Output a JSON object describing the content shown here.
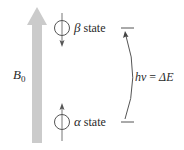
{
  "diagram": {
    "field": {
      "label": "B",
      "subscript": "0",
      "arrow_color": "#cbcbcb"
    },
    "beta": {
      "symbol": "β",
      "label": " state",
      "spin_direction": "down"
    },
    "alpha": {
      "symbol": "α",
      "label": " state",
      "spin_direction": "up"
    },
    "transition": {
      "lhs": "hν",
      "equals": " = ",
      "rhs": "ΔE"
    },
    "colors": {
      "line": "#555555",
      "text": "#2a2a2a"
    }
  }
}
